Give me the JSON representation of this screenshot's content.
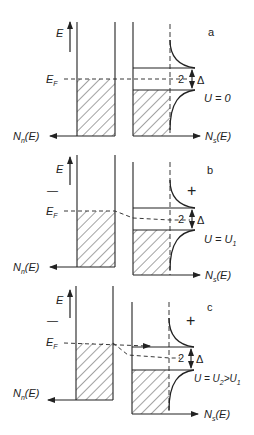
{
  "figure": {
    "panels": [
      {
        "id": "a",
        "tag": "a",
        "energy_label": "E",
        "fermi_label": "E",
        "fermi_sub": "F",
        "normal_dos_label": "N",
        "normal_dos_sub": "n",
        "normal_dos_tail": "(E)",
        "super_dos_label": "N",
        "super_dos_sub": "s",
        "super_dos_tail": "(E)",
        "gap_label": "2",
        "delta_label": "Δ",
        "voltage_label": "U = 0",
        "sign_minus": "",
        "sign_plus": ""
      },
      {
        "id": "b",
        "tag": "b",
        "energy_label": "E",
        "fermi_label": "E",
        "fermi_sub": "F",
        "normal_dos_label": "N",
        "normal_dos_sub": "n",
        "normal_dos_tail": "(E)",
        "super_dos_label": "N",
        "super_dos_sub": "s",
        "super_dos_tail": "(E)",
        "gap_label": "2",
        "delta_label": "Δ",
        "voltage_label": "U = U",
        "voltage_sub": "1",
        "sign_minus": "—",
        "sign_plus": "+"
      },
      {
        "id": "c",
        "tag": "c",
        "energy_label": "E",
        "fermi_label": "E",
        "fermi_sub": "F",
        "normal_dos_label": "N",
        "normal_dos_sub": "n",
        "normal_dos_tail": "(E)",
        "super_dos_label": "N",
        "super_dos_sub": "s",
        "super_dos_tail": "(E)",
        "gap_label": "2",
        "delta_label": "Δ",
        "voltage_label": "U = U",
        "voltage_sub": "2",
        "voltage_gt": ">U",
        "voltage_sub2": "1",
        "sign_minus": "—",
        "sign_plus": "+"
      }
    ]
  }
}
